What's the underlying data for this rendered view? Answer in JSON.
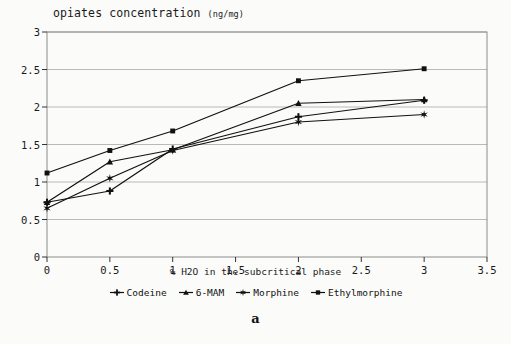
{
  "chart_data": {
    "type": "line",
    "title": "opiates concentration",
    "title_units": "(ng/mg)",
    "xlabel": "% H2O in the subcritical phase",
    "ylabel": "",
    "panel_label": "a",
    "xlim": [
      0,
      3.5
    ],
    "ylim": [
      0,
      3
    ],
    "xticks": [
      "0",
      "0.5",
      "1",
      "1.5",
      "2",
      "2.5",
      "3",
      "3.5"
    ],
    "yticks": [
      "0",
      "0.5",
      "1",
      "1.5",
      "2",
      "2.5",
      "3"
    ],
    "grid": "horizontal",
    "legend_position": "bottom",
    "x": [
      0,
      0.5,
      1,
      2,
      3
    ],
    "series": [
      {
        "name": "Codeine",
        "marker": "plus",
        "values": [
          0.73,
          0.88,
          1.44,
          1.87,
          2.09
        ]
      },
      {
        "name": "6-MAM",
        "marker": "triangle",
        "values": [
          0.73,
          1.27,
          1.43,
          2.05,
          2.1
        ]
      },
      {
        "name": "Morphine",
        "marker": "star",
        "values": [
          0.65,
          1.05,
          1.42,
          1.8,
          1.9
        ]
      },
      {
        "name": "Ethylmorphine",
        "marker": "square",
        "values": [
          1.12,
          1.42,
          1.68,
          2.35,
          2.51
        ]
      }
    ],
    "colors": {
      "ink": "#111111",
      "grid": "#b9b9b9",
      "frame": "#8c8c8c",
      "background": "#fbfbf9"
    }
  }
}
